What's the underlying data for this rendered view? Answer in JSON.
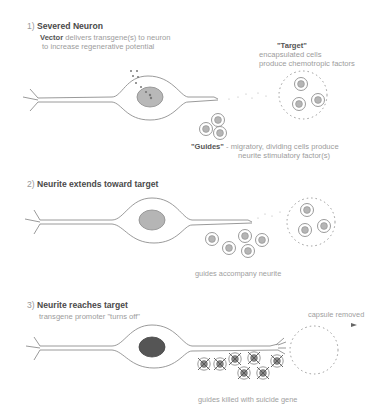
{
  "panel1": {
    "number": "1)",
    "title": "Severed Neuron",
    "vector_term": "Vector",
    "vector_desc_line1": " delivers transgene(s) to neuron",
    "vector_desc_line2": "to increase regenerative potential",
    "target_term": "\"Target\"",
    "target_desc_line1": "encapsulated cells",
    "target_desc_line2": "produce chemotropic factors",
    "guides_term": "\"Guides\"",
    "guides_desc_line1": " - migratory, dividing cells produce",
    "guides_desc_line2": "neurite stimulatory factor(s)"
  },
  "panel2": {
    "number": "2)",
    "title": "Neurite extends toward target",
    "caption": "guides accompany neurite"
  },
  "panel3": {
    "number": "3)",
    "title": "Neurite reaches target",
    "subtitle": "transgene promoter \"turns off\"",
    "capsule_label": "capsule removed",
    "caption": "guides killed with suicide gene"
  },
  "colors": {
    "line": "#8f8f8f",
    "nucleus_light": "#b8b8b8",
    "nucleus_dark": "#5a5a5a",
    "text_dark": "#4a4a4a",
    "text_light": "#9c9c9c"
  }
}
